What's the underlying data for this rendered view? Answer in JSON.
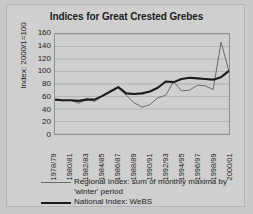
{
  "chart_data": {
    "type": "line",
    "title": "Indices for Great Crested Grebes",
    "xlabel": "",
    "ylabel": "Index: 2000/1=100",
    "ylim": [
      0,
      160
    ],
    "ytick_step": 20,
    "yticks": [
      160,
      140,
      120,
      100,
      80,
      60,
      40,
      20,
      0
    ],
    "grid": true,
    "legend_position": "below",
    "x": [
      "1978/79",
      "1979/80",
      "1980/81",
      "1981/82",
      "1982/83",
      "1983/84",
      "1984/85",
      "1985/86",
      "1986/87",
      "1987/88",
      "1988/89",
      "1989/90",
      "1990/91",
      "1991/92",
      "1992/93",
      "1993/94",
      "1994/95",
      "1995/96",
      "1996/97",
      "1997/98",
      "1998/99",
      "1999/00",
      "2000/01"
    ],
    "xtick_labels": [
      "1978/79",
      "1980/81",
      "1982/83",
      "1984/85",
      "1986/87",
      "1988/89",
      "1990/91",
      "1992/93",
      "1994/95",
      "1996/97",
      "1998/99",
      "2000/01"
    ],
    "series": [
      {
        "name": "Regional Index: sum of monthly maxima by 'winter' period",
        "style": "thin",
        "color": "#6b6b6b",
        "values": [
          55,
          53,
          54,
          49,
          57,
          52,
          61,
          68,
          74,
          62,
          50,
          43,
          47,
          58,
          62,
          84,
          69,
          70,
          78,
          77,
          71,
          147,
          100
        ]
      },
      {
        "name": "National Index: WeBS",
        "style": "thick",
        "color": "#1c1c1c",
        "values": [
          55,
          54,
          54,
          53,
          55,
          55,
          61,
          68,
          75,
          65,
          64,
          65,
          68,
          74,
          84,
          83,
          88,
          90,
          89,
          88,
          87,
          91,
          101
        ]
      }
    ]
  },
  "legend": {
    "regional_line1": "Regional Index: sum of monthly maxima by",
    "regional_line2": "'winter' period",
    "national": "National Index: WeBS"
  }
}
